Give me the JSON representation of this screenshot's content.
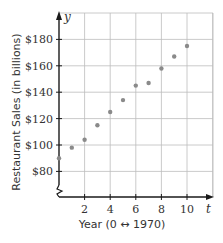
{
  "chart_data": {
    "type": "scatter",
    "title": "",
    "xlabel": "Year (0 ↔ 1970)",
    "ylabel": "Restaurant Sales (in billions)",
    "x_axis_variable": "t",
    "y_axis_variable": "y",
    "x": [
      0,
      1,
      2,
      3,
      4,
      5,
      6,
      7,
      8,
      9,
      10
    ],
    "y": [
      90,
      98,
      104,
      115,
      125,
      134,
      145,
      147,
      158,
      167,
      175
    ],
    "x_ticks": [
      2,
      4,
      6,
      8,
      10
    ],
    "x_tick_labels": [
      "2",
      "4",
      "6",
      "8",
      "10"
    ],
    "y_ticks": [
      80,
      100,
      120,
      140,
      160,
      180
    ],
    "y_tick_labels": [
      "$80",
      "$100",
      "$120",
      "$140",
      "$160",
      "$180"
    ],
    "xlim": [
      0,
      12
    ],
    "ylim": [
      65,
      200
    ],
    "y_axis_break": true,
    "grid": true,
    "legend": null,
    "point_color": "#8a8a8a",
    "grid_color": "#bdbdbd",
    "axis_color": "#1a1a1a"
  }
}
